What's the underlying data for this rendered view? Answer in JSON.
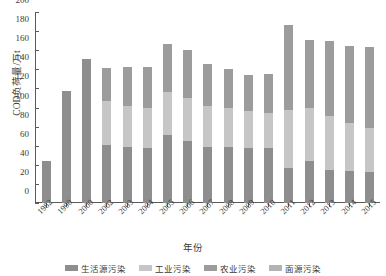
{
  "chart_data": {
    "type": "bar",
    "stacked": true,
    "title": "",
    "xlabel": "年份",
    "ylabel": "COD负荷量/万t",
    "ylim": [
      0,
      200
    ],
    "ytick_values": [
      0,
      20,
      40,
      60,
      80,
      100,
      120,
      140,
      160,
      180,
      200
    ],
    "grid": false,
    "legend_position": "bottom",
    "categories": [
      "1982",
      "1990",
      "2000",
      "2002",
      "2003",
      "2004",
      "2005",
      "2006",
      "2007",
      "2008",
      "2009",
      "2010",
      "2011",
      "2012",
      "2013",
      "2014",
      "2015"
    ],
    "series": [
      {
        "name": "生活源污染",
        "color": "#8e8e8e",
        "values": [
          44,
          117,
          151,
          61,
          59,
          58,
          71,
          65,
          59,
          59,
          58,
          58,
          37,
          44,
          35,
          34,
          32
        ]
      },
      {
        "name": "工业污染",
        "color": "#c6c6c6",
        "values": [
          0,
          0,
          0,
          46,
          43,
          42,
          45,
          45,
          43,
          40,
          38,
          36,
          60,
          55,
          56,
          50,
          47
        ]
      },
      {
        "name": "农业污染",
        "color": "#9c9c9c",
        "values": [
          0,
          0,
          0,
          34,
          40,
          42,
          50,
          50,
          44,
          41,
          38,
          41,
          89,
          72,
          79,
          80,
          84
        ]
      },
      {
        "name": "面源污染",
        "color": "#b3b3b3",
        "values": [
          0,
          0,
          0,
          0,
          0,
          0,
          0,
          0,
          0,
          0,
          0,
          0,
          0,
          0,
          0,
          0,
          0
        ]
      }
    ],
    "totals": [
      44,
      117,
      151,
      141,
      142,
      142,
      166,
      160,
      146,
      140,
      134,
      135,
      186,
      171,
      170,
      164,
      163
    ]
  },
  "axis": {
    "y_title": "COD负荷量/万t",
    "x_title": "年份"
  },
  "legend": {
    "items": [
      {
        "label": "生活源污染",
        "color": "#8e8e8e"
      },
      {
        "label": "工业污染",
        "color": "#c6c6c6"
      },
      {
        "label": "农业污染",
        "color": "#9c9c9c"
      },
      {
        "label": "面源污染",
        "color": "#b3b3b3"
      }
    ]
  }
}
